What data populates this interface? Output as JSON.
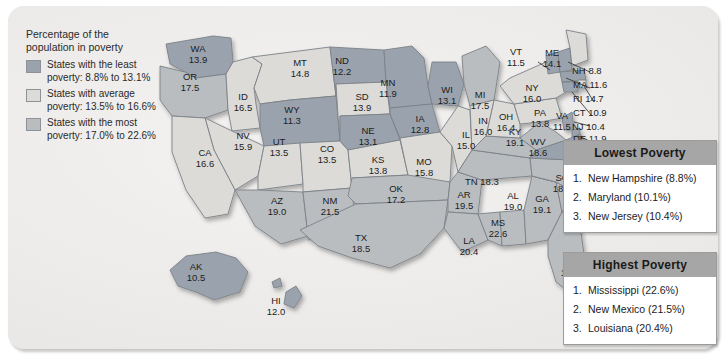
{
  "legend": {
    "title_line1": "Percentage of the",
    "title_line2": "population in poverty",
    "items": [
      {
        "swatch": "least",
        "line1": "States with the least",
        "line2": "poverty: 8.8% to 13.1%"
      },
      {
        "swatch": "average",
        "line1": "States with average",
        "line2": "poverty: 13.5% to 16.6%"
      },
      {
        "swatch": "most",
        "line1": "States with the most",
        "line2": "poverty: 17.0% to 22.6%"
      }
    ]
  },
  "colors": {
    "least": "#9aa3ad",
    "average": "#dcdbd7",
    "most": "#b9bdc0",
    "panel_background": "#ecebe9",
    "box_header": "#a6a6a6",
    "text": "#1c1c1c"
  },
  "chart_data": {
    "type": "map",
    "title": "Percentage of the population in poverty",
    "unit": "percent",
    "categories": [
      "least",
      "average",
      "most"
    ],
    "category_ranges": {
      "least": [
        8.8,
        13.1
      ],
      "average": [
        13.5,
        16.6
      ],
      "most": [
        17.0,
        22.6
      ]
    },
    "states": [
      {
        "abbr": "WA",
        "value": "13.9",
        "class": "least"
      },
      {
        "abbr": "OR",
        "value": "17.5",
        "class": "most"
      },
      {
        "abbr": "ID",
        "value": "16.5",
        "class": "average"
      },
      {
        "abbr": "MT",
        "value": "14.8",
        "class": "average"
      },
      {
        "abbr": "WY",
        "value": "11.3",
        "class": "least"
      },
      {
        "abbr": "ND",
        "value": "12.2",
        "class": "least"
      },
      {
        "abbr": "SD",
        "value": "13.9",
        "class": "average"
      },
      {
        "abbr": "NE",
        "value": "13.1",
        "class": "least"
      },
      {
        "abbr": "MN",
        "value": "11.9",
        "class": "least"
      },
      {
        "abbr": "IA",
        "value": "12.8",
        "class": "least"
      },
      {
        "abbr": "WI",
        "value": "13.1",
        "class": "least"
      },
      {
        "abbr": "MI",
        "value": "17.5",
        "class": "most"
      },
      {
        "abbr": "NV",
        "value": "15.9",
        "class": "average"
      },
      {
        "abbr": "UT",
        "value": "13.5",
        "class": "average"
      },
      {
        "abbr": "CO",
        "value": "13.5",
        "class": "average"
      },
      {
        "abbr": "CA",
        "value": "16.6",
        "class": "average"
      },
      {
        "abbr": "AZ",
        "value": "19.0",
        "class": "most"
      },
      {
        "abbr": "NM",
        "value": "21.5",
        "class": "most"
      },
      {
        "abbr": "KS",
        "value": "13.8",
        "class": "average"
      },
      {
        "abbr": "MO",
        "value": "15.8",
        "class": "average"
      },
      {
        "abbr": "IL",
        "value": "15.0",
        "class": "average"
      },
      {
        "abbr": "IN",
        "value": "16.0",
        "class": "average"
      },
      {
        "abbr": "OH",
        "value": "16.4",
        "class": "average"
      },
      {
        "abbr": "KY",
        "value": "19.1",
        "class": "most"
      },
      {
        "abbr": "WV",
        "value": "18.6",
        "class": "most"
      },
      {
        "abbr": "VA",
        "value": "11.5",
        "class": "least"
      },
      {
        "abbr": "OK",
        "value": "17.2",
        "class": "most"
      },
      {
        "abbr": "AR",
        "value": "19.5",
        "class": "most"
      },
      {
        "abbr": "TN",
        "value": "18.3",
        "class": "most"
      },
      {
        "abbr": "NC",
        "value": "17.9",
        "class": "most"
      },
      {
        "abbr": "SC",
        "value": "18.9",
        "class": "most"
      },
      {
        "abbr": "MS",
        "value": "22.6",
        "class": "most"
      },
      {
        "abbr": "AL",
        "value": "19.0",
        "class": "most"
      },
      {
        "abbr": "GA",
        "value": "19.1",
        "class": "most"
      },
      {
        "abbr": "TX",
        "value": "18.5",
        "class": "most"
      },
      {
        "abbr": "LA",
        "value": "20.4",
        "class": "most"
      },
      {
        "abbr": "FL",
        "value": "17.0",
        "class": "most"
      },
      {
        "abbr": "PA",
        "value": "13.8",
        "class": "average"
      },
      {
        "abbr": "NY",
        "value": "16.0",
        "class": "average"
      },
      {
        "abbr": "VT",
        "value": "11.5",
        "class": "least"
      },
      {
        "abbr": "ME",
        "value": "14.1",
        "class": "average"
      },
      {
        "abbr": "NH",
        "value": "8.8",
        "class": "least"
      },
      {
        "abbr": "MA",
        "value": "11.6",
        "class": "least"
      },
      {
        "abbr": "RI",
        "value": "14.7",
        "class": "average"
      },
      {
        "abbr": "CT",
        "value": "10.9",
        "class": "least"
      },
      {
        "abbr": "NJ",
        "value": "10.4",
        "class": "least"
      },
      {
        "abbr": "DE",
        "value": "11.9",
        "class": "least"
      },
      {
        "abbr": "MD",
        "value": "10.1",
        "class": "least"
      },
      {
        "abbr": "DC",
        "value": "18.7",
        "class": "most"
      },
      {
        "abbr": "AK",
        "value": "10.5",
        "class": "least"
      },
      {
        "abbr": "HI",
        "value": "12.0",
        "class": "least"
      }
    ]
  },
  "lowest_box": {
    "header": "Lowest Poverty",
    "items": [
      {
        "num": "1.",
        "text": "New Hampshire (8.8%)"
      },
      {
        "num": "2.",
        "text": "Maryland (10.1%)"
      },
      {
        "num": "3.",
        "text": "New Jersey (10.4%)"
      }
    ]
  },
  "highest_box": {
    "header": "Highest Poverty",
    "items": [
      {
        "num": "1.",
        "text": "Mississippi (22.6%)"
      },
      {
        "num": "2.",
        "text": "New Mexico (21.5%)"
      },
      {
        "num": "3.",
        "text": "Louisiana (20.4%)"
      }
    ]
  }
}
